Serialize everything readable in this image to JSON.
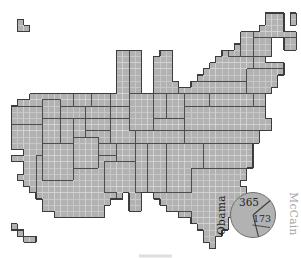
{
  "figure": {
    "pie": {
      "obama_label": "Obama",
      "obama_votes": "365",
      "mccain_label": "McCain",
      "mccain_votes": "173"
    },
    "colors": {
      "background": "#ffffff",
      "cell_fill": "#b2b2b2",
      "grid_line": "#d9d9d9",
      "state_border": "#474747",
      "outer_border": "#3d3d3d",
      "pie_fill": "#b2b2b2",
      "pie_outline": "#6f6f6f",
      "pie_divider": "#3d3d3d",
      "obama_label_color": "#1f1f1f",
      "mccain_label_color": "#a6a6a6",
      "value_color": "#262626"
    },
    "map": {
      "grid_rows": [
        "..........................................###.#.",
        "..#.......................................###.#.",
        "..##.....................................####...",
        "......................................#########.",
        "......................................#####..##.",
        ".....................................######..##.",
        "..................####...##........########.....",
        "..................####..###.......########......",
        "..................####..###......############...",
        "..................####..###.....#############...",
        "..................####..###....#############....",
        "..................####..####..##############....",
        "..................####..###################.....",
        "....######################################......",
        "..########################################......",
        ".#########################################......",
        ".#########################################......",
        ".##########################################.....",
        ".##########################################.....",
        ".########################################.......",
        ".########################################.......",
        ".#######################################........",
        "...#####################################........",
        ".#######################################........",
        "...#####################################........",
        "...####################################.........",
        "..#####################################.........",
        "...###################################..........",
        "....###################################.........",
        ".....##############.##..###############.........",
        "......###########...##...#############..........",
        "......##########....##....###########...........",
        "........########............#########...........",
        "..............................######............",
        ".#.............................#####............",
        "..#.............................###.............",
        "...##...........................##..............",
        ".................................#.............."
      ],
      "states": [
        {
          "id": "WA",
          "rect": [
            2,
            13,
            10,
            14
          ]
        },
        {
          "id": "OR",
          "rect": [
            1,
            15,
            5,
            17
          ]
        },
        {
          "id": "CA",
          "rect": [
            1,
            18,
            5,
            28
          ]
        },
        {
          "id": "ID",
          "rect": [
            6,
            14,
            8,
            16
          ]
        },
        {
          "id": "NV",
          "rect": [
            6,
            17,
            8,
            20
          ]
        },
        {
          "id": "MT",
          "rect": [
            11,
            13,
            13,
            14
          ]
        },
        {
          "id": "ND",
          "rect": [
            14,
            13,
            16,
            14
          ]
        },
        {
          "id": "MN",
          "rect": [
            18,
            6,
            19,
            12
          ]
        },
        {
          "id": "MN",
          "rect": [
            17,
            13,
            19,
            14
          ]
        },
        {
          "id": "WY",
          "rect": [
            9,
            15,
            12,
            16
          ]
        },
        {
          "id": "SD",
          "rect": [
            13,
            15,
            16,
            16
          ]
        },
        {
          "id": "UT",
          "rect": [
            9,
            17,
            10,
            20
          ]
        },
        {
          "id": "CO",
          "rect": [
            11,
            17,
            12,
            19
          ]
        },
        {
          "id": "NE",
          "rect": [
            13,
            17,
            16,
            18
          ]
        },
        {
          "id": "KS",
          "rect": [
            13,
            19,
            16,
            20
          ]
        },
        {
          "id": "TX",
          "rect": [
            5,
            23,
            17,
            32
          ]
        },
        {
          "id": "AZ",
          "rect": [
            6,
            21,
            10,
            26
          ]
        },
        {
          "id": "NM",
          "rect": [
            11,
            20,
            14,
            24
          ]
        },
        {
          "id": "OK",
          "rect": [
            15,
            21,
            17,
            22
          ]
        },
        {
          "id": "AR",
          "rect": [
            18,
            21,
            20,
            23
          ]
        },
        {
          "id": "IA",
          "rect": [
            17,
            15,
            20,
            16
          ]
        },
        {
          "id": "MO",
          "rect": [
            17,
            17,
            20,
            20
          ]
        },
        {
          "id": "LA",
          "rect": [
            16,
            24,
            20,
            28
          ]
        },
        {
          "id": "IL",
          "rect": [
            20,
            13,
            23,
            18
          ]
        },
        {
          "id": "WI",
          "rect": [
            20,
            6,
            21,
            12
          ]
        },
        {
          "id": "MI",
          "rect": [
            24,
            6,
            27,
            12
          ]
        },
        {
          "id": "IN",
          "rect": [
            24,
            13,
            25,
            16
          ]
        },
        {
          "id": "OH",
          "rect": [
            26,
            13,
            29,
            16
          ]
        },
        {
          "id": "WV",
          "rect": [
            29,
            13,
            32,
            14
          ]
        },
        {
          "id": "KY",
          "rect": [
            24,
            17,
            28,
            18
          ]
        },
        {
          "id": "TN",
          "rect": [
            21,
            19,
            28,
            20
          ]
        },
        {
          "id": "MS",
          "rect": [
            21,
            21,
            22,
            29
          ]
        },
        {
          "id": "AL",
          "rect": [
            23,
            21,
            25,
            29
          ]
        },
        {
          "id": "GA",
          "rect": [
            26,
            21,
            31,
            28
          ]
        },
        {
          "id": "LA",
          "rect": [
            18,
            29,
            21,
            31
          ]
        },
        {
          "id": "NY",
          "rect": [
            30,
            6,
            40,
            10
          ]
        },
        {
          "id": "VT",
          "rect": [
            36,
            2,
            37,
            6
          ]
        },
        {
          "id": "NH",
          "rect": [
            38,
            2,
            39,
            6
          ]
        },
        {
          "id": "ME",
          "rect": [
            40,
            0,
            47,
            3
          ]
        },
        {
          "id": "MA",
          "rect": [
            40,
            4,
            44,
            6
          ]
        },
        {
          "id": "RI",
          "rect": [
            45,
            4,
            46,
            6
          ]
        },
        {
          "id": "CT",
          "rect": [
            40,
            7,
            46,
            8
          ]
        },
        {
          "id": "NJ",
          "rect": [
            39,
            9,
            44,
            12
          ]
        },
        {
          "id": "PA",
          "rect": [
            28,
            11,
            38,
            12
          ]
        },
        {
          "id": "MD",
          "rect": [
            33,
            13,
            39,
            14
          ]
        },
        {
          "id": "DE",
          "rect": [
            40,
            13,
            41,
            14
          ]
        },
        {
          "id": "VA",
          "rect": [
            29,
            15,
            42,
            18
          ]
        },
        {
          "id": "NC",
          "rect": [
            29,
            19,
            40,
            20
          ]
        },
        {
          "id": "SC",
          "rect": [
            32,
            21,
            39,
            24
          ]
        },
        {
          "id": "FL",
          "rect": [
            30,
            25,
            38,
            37
          ]
        },
        {
          "id": "FL",
          "rect": [
            24,
            29,
            29,
            31
          ]
        },
        {
          "id": "AK",
          "rect": [
            2,
            1,
            3,
            2
          ]
        },
        {
          "id": "HI",
          "rect": [
            1,
            34,
            4,
            36
          ]
        }
      ]
    }
  },
  "chart_data": {
    "type": "pie",
    "title": "",
    "slices": [
      {
        "label": "Obama",
        "value": 365
      },
      {
        "label": "McCain",
        "value": 173
      }
    ]
  }
}
